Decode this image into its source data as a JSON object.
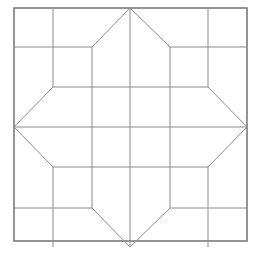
{
  "figure": {
    "title": "",
    "caption_fragment": "",
    "colors": {
      "background": "#ffffff",
      "line": "#8a8a8a",
      "border": "#7a7a7a"
    },
    "outer_square": {
      "x": 14,
      "y": 8,
      "size": 233
    },
    "grid_positions": [
      14,
      53,
      92,
      130,
      170,
      208,
      247
    ],
    "row_positions": [
      8,
      47,
      87,
      127,
      167,
      208,
      247
    ],
    "lines": [
      {
        "id": "center-vertical",
        "x1": 130,
        "y1": 8,
        "x2": 130,
        "y2": 247
      },
      {
        "id": "center-horizontal",
        "x1": 14,
        "y1": 127,
        "x2": 247,
        "y2": 127
      },
      {
        "id": "top-left-vertical",
        "x1": 53,
        "y1": 8,
        "x2": 53,
        "y2": 87
      },
      {
        "id": "top-right-vertical",
        "x1": 208,
        "y1": 8,
        "x2": 208,
        "y2": 87
      },
      {
        "id": "bottom-left-vertical",
        "x1": 53,
        "y1": 167,
        "x2": 53,
        "y2": 247
      },
      {
        "id": "bottom-right-vertical",
        "x1": 208,
        "y1": 167,
        "x2": 208,
        "y2": 247
      },
      {
        "id": "top-left-horizontal",
        "x1": 14,
        "y1": 47,
        "x2": 92,
        "y2": 47
      },
      {
        "id": "top-right-horizontal",
        "x1": 170,
        "y1": 47,
        "x2": 247,
        "y2": 47
      },
      {
        "id": "bottom-left-horizontal",
        "x1": 14,
        "y1": 208,
        "x2": 92,
        "y2": 208
      },
      {
        "id": "bottom-right-horizontal",
        "x1": 170,
        "y1": 208,
        "x2": 247,
        "y2": 208
      },
      {
        "id": "inner-left-vertical",
        "x1": 92,
        "y1": 47,
        "x2": 92,
        "y2": 208
      },
      {
        "id": "inner-right-vertical",
        "x1": 170,
        "y1": 47,
        "x2": 170,
        "y2": 208
      },
      {
        "id": "inner-top-horizontal",
        "x1": 53,
        "y1": 87,
        "x2": 208,
        "y2": 87
      },
      {
        "id": "inner-bottom-horizontal",
        "x1": 53,
        "y1": 167,
        "x2": 208,
        "y2": 167
      },
      {
        "id": "top-arm-left-diagonal",
        "x1": 130,
        "y1": 8,
        "x2": 92,
        "y2": 47
      },
      {
        "id": "top-arm-right-diagonal",
        "x1": 130,
        "y1": 8,
        "x2": 170,
        "y2": 47
      },
      {
        "id": "bottom-arm-left-diagonal",
        "x1": 92,
        "y1": 208,
        "x2": 130,
        "y2": 247
      },
      {
        "id": "bottom-arm-right-diagonal",
        "x1": 170,
        "y1": 208,
        "x2": 130,
        "y2": 247
      },
      {
        "id": "left-arm-top-diagonal",
        "x1": 53,
        "y1": 87,
        "x2": 14,
        "y2": 127
      },
      {
        "id": "left-arm-bottom-diagonal",
        "x1": 14,
        "y1": 127,
        "x2": 53,
        "y2": 167
      },
      {
        "id": "right-arm-top-diagonal",
        "x1": 208,
        "y1": 87,
        "x2": 247,
        "y2": 127
      },
      {
        "id": "right-arm-bottom-diagonal",
        "x1": 247,
        "y1": 127,
        "x2": 208,
        "y2": 167
      }
    ]
  }
}
